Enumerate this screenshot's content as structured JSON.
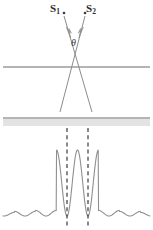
{
  "figure": {
    "width": 153,
    "height": 230,
    "background_color": "#ffffff"
  },
  "labels": {
    "source1": "S",
    "source1_sub": "1",
    "source2": "S",
    "source2_sub": "2",
    "angle": "θ"
  },
  "colors": {
    "line": "#6b6b6b",
    "beam": "#8c8c8c",
    "curve": "#8f8f8f",
    "dashed": "#3a3a3a",
    "band_fill": "#e3e3e3",
    "text": "#2b2b2b"
  },
  "geometry": {
    "source1_point": {
      "x": 64,
      "y": 13
    },
    "source2_point": {
      "x": 85,
      "y": 13
    },
    "crossing_point": {
      "x": 76,
      "y": 67
    },
    "upper_line_y": 67,
    "lower_line_y": 118,
    "band_top_y": 119,
    "band_bottom_y": 126,
    "line_x_start": 3,
    "line_x_end": 150,
    "beam1": {
      "x1": 64,
      "y1": 16,
      "x2": 92,
      "y2": 112
    },
    "beam2": {
      "x1": 85,
      "y1": 16,
      "x2": 60,
      "y2": 112
    },
    "arrow1": {
      "x": 70,
      "y": 35
    },
    "arrow2": {
      "x": 81,
      "y": 35
    },
    "dashed_line_left_x": 67,
    "dashed_line_right_x": 88,
    "dashed_top_y": 128,
    "dashed_bottom_y": 228
  },
  "chart_data": {
    "type": "line",
    "xlabel": "",
    "ylabel": "",
    "baseline_y": 216,
    "peak_y": 150,
    "peak_positions": [
      67,
      88
    ],
    "peak_values": [
      1.0,
      1.0
    ],
    "side_lobe_count_each_side": 6,
    "side_lobe_values": [
      0.085,
      0.07,
      0.055,
      0.045,
      0.035,
      0.025
    ],
    "xlim": [
      3,
      150
    ],
    "ylim": [
      0,
      1
    ],
    "grid": false,
    "legend": false
  }
}
